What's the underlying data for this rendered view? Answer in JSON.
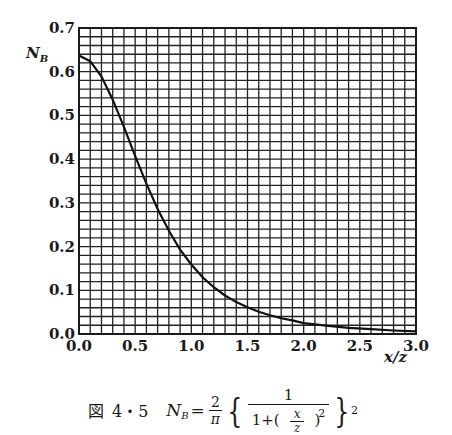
{
  "chart_data": {
    "type": "line",
    "title": "",
    "xlabel": "x/z",
    "ylabel": "N_B",
    "xlim": [
      0.0,
      3.0
    ],
    "ylim": [
      0.0,
      0.7
    ],
    "grid": true,
    "grid_minor_x_step": 0.1,
    "grid_minor_y_step": 0.02,
    "x_ticks": [
      "0.0",
      "0.5",
      "1.0",
      "1.5",
      "2.0",
      "2.5",
      "3.0"
    ],
    "y_ticks": [
      "0.0",
      "0.1",
      "0.2",
      "0.3",
      "0.4",
      "0.5",
      "0.6",
      "0.7"
    ],
    "legend": "none",
    "series": [
      {
        "name": "N_B = (2/π)·{1/(1+(x/z)²)}²",
        "x": [
          0.0,
          0.1,
          0.2,
          0.3,
          0.4,
          0.5,
          0.6,
          0.7,
          0.8,
          0.9,
          1.0,
          1.1,
          1.2,
          1.3,
          1.4,
          1.5,
          1.6,
          1.7,
          1.8,
          1.9,
          2.0,
          2.2,
          2.4,
          2.6,
          2.8,
          3.0
        ],
        "y": [
          0.637,
          0.624,
          0.589,
          0.536,
          0.474,
          0.407,
          0.344,
          0.286,
          0.236,
          0.193,
          0.159,
          0.13,
          0.107,
          0.088,
          0.073,
          0.061,
          0.051,
          0.043,
          0.036,
          0.031,
          0.025,
          0.019,
          0.014,
          0.011,
          0.008,
          0.006
        ]
      }
    ]
  },
  "labels": {
    "y_axis_symbol": "N",
    "y_axis_subscript": "B",
    "x_axis_label": "x/z"
  },
  "caption": {
    "figure_mark": "図",
    "figure_number": "4・5",
    "lhs": "N",
    "lhs_sub": "B",
    "equals": "=",
    "coef_num": "2",
    "coef_den": "π",
    "inner_num": "1",
    "inner_den_prefix": "1+",
    "inner_frac_num": "x",
    "inner_frac_den": "z",
    "inner_exp": "2",
    "outer_exp": "2",
    "brace_open": "{",
    "brace_close": "}",
    "paren_open": "(",
    "paren_close": ")"
  }
}
